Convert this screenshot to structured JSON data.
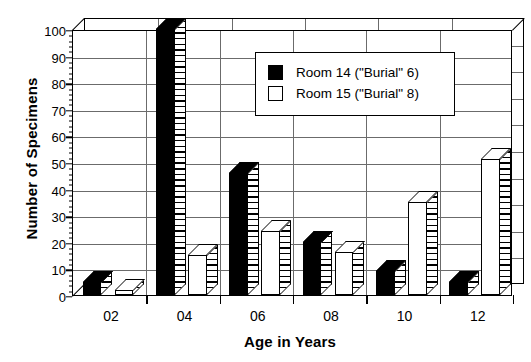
{
  "chart_data": {
    "type": "bar",
    "title": "",
    "xlabel": "Age in Years",
    "ylabel": "Number of Specimens",
    "categories": [
      "02",
      "04",
      "06",
      "08",
      "10",
      "12"
    ],
    "series": [
      {
        "name": "Room 14 (\"Burial\" 6)",
        "color": "#000000",
        "values": [
          5,
          100,
          46,
          20,
          9,
          5
        ]
      },
      {
        "name": "Room 15 (\"Burial\" 8)",
        "color": "#ffffff",
        "values": [
          2,
          15,
          24,
          16,
          35,
          51
        ]
      }
    ],
    "ylim": [
      0,
      100
    ],
    "yticks": [
      0,
      10,
      20,
      30,
      40,
      50,
      60,
      70,
      80,
      90,
      100
    ],
    "ytick_labels": [
      "0",
      "10",
      "20",
      "30",
      "40",
      "50",
      "60",
      "70",
      "80",
      "90",
      "100"
    ],
    "grid": true,
    "legend_position": "upper-center",
    "style": "3d-grouped-bars"
  },
  "legend": {
    "entries": [
      {
        "label": "Room 14 (\"Burial\" 6)",
        "swatch": "black"
      },
      {
        "label": "Room 15 (\"Burial\" 8)",
        "swatch": "white"
      }
    ]
  }
}
